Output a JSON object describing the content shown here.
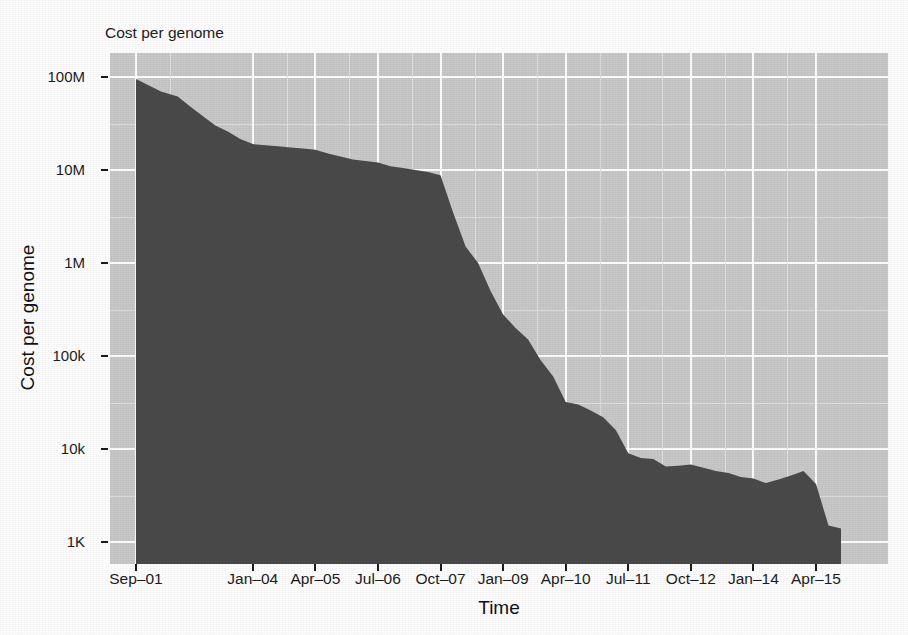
{
  "chart_data": {
    "type": "area",
    "title": "Cost per genome",
    "xlabel": "Time",
    "ylabel": "Cost per genome",
    "grid": true,
    "legend": false,
    "yscale": "log",
    "ylim": [
      1000,
      200000000
    ],
    "y_tick_labels": [
      "100M",
      "10M",
      "1M",
      "100k",
      "10k",
      "1K"
    ],
    "y_tick_values": [
      100000000,
      10000000,
      1000000,
      100000,
      10000,
      1000
    ],
    "x_tick_labels": [
      "Sep–01",
      "Jan–04",
      "Apr–05",
      "Jul–06",
      "Oct–07",
      "Jan–09",
      "Apr–10",
      "Jul–11",
      "Oct–12",
      "Jan–14",
      "Apr–15"
    ],
    "colors": {
      "area_fill": "#4a4a4a",
      "panel_background": "#c9c9c9",
      "gridline": "#ffffff",
      "text": "#1c1c1c",
      "figure_background": "#ffffff"
    },
    "series": [
      {
        "name": "Cost per genome",
        "points": [
          {
            "x": "Sep-01",
            "y": 95000000
          },
          {
            "x": "Mar-02",
            "y": 70000000
          },
          {
            "x": "Jul-02",
            "y": 61500000
          },
          {
            "x": "Oct-02",
            "y": 48000000
          },
          {
            "x": "Jan-03",
            "y": 38000000
          },
          {
            "x": "Apr-03",
            "y": 30000000
          },
          {
            "x": "Jul-03",
            "y": 26000000
          },
          {
            "x": "Oct-03",
            "y": 21500000
          },
          {
            "x": "Jan-04",
            "y": 19000000
          },
          {
            "x": "Apr-04",
            "y": 18500000
          },
          {
            "x": "Jul-04",
            "y": 18000000
          },
          {
            "x": "Oct-04",
            "y": 17500000
          },
          {
            "x": "Jan-05",
            "y": 17000000
          },
          {
            "x": "Apr-05",
            "y": 16500000
          },
          {
            "x": "Jul-05",
            "y": 15000000
          },
          {
            "x": "Oct-05",
            "y": 14000000
          },
          {
            "x": "Jan-06",
            "y": 13000000
          },
          {
            "x": "Apr-06",
            "y": 12500000
          },
          {
            "x": "Jul-06",
            "y": 12000000
          },
          {
            "x": "Oct-06",
            "y": 11000000
          },
          {
            "x": "Jan-07",
            "y": 10500000
          },
          {
            "x": "Apr-07",
            "y": 10000000
          },
          {
            "x": "Jul-07",
            "y": 9500000
          },
          {
            "x": "Oct-07",
            "y": 8800000
          },
          {
            "x": "Jan-08",
            "y": 3500000
          },
          {
            "x": "Apr-08",
            "y": 1500000
          },
          {
            "x": "Jul-08",
            "y": 1000000
          },
          {
            "x": "Oct-08",
            "y": 500000
          },
          {
            "x": "Jan-09",
            "y": 280000
          },
          {
            "x": "Apr-09",
            "y": 200000
          },
          {
            "x": "Jul-09",
            "y": 150000
          },
          {
            "x": "Oct-09",
            "y": 90000
          },
          {
            "x": "Jan-10",
            "y": 60000
          },
          {
            "x": "Apr-10",
            "y": 32000
          },
          {
            "x": "Jul-10",
            "y": 30000
          },
          {
            "x": "Oct-10",
            "y": 26000
          },
          {
            "x": "Jan-11",
            "y": 22000
          },
          {
            "x": "Apr-11",
            "y": 16000
          },
          {
            "x": "Jul-11",
            "y": 9000
          },
          {
            "x": "Oct-11",
            "y": 8000
          },
          {
            "x": "Jan-12",
            "y": 7800
          },
          {
            "x": "Apr-12",
            "y": 6500
          },
          {
            "x": "Jul-12",
            "y": 6600
          },
          {
            "x": "Oct-12",
            "y": 6800
          },
          {
            "x": "Jan-13",
            "y": 6300
          },
          {
            "x": "Apr-13",
            "y": 5800
          },
          {
            "x": "Jul-13",
            "y": 5500
          },
          {
            "x": "Oct-13",
            "y": 5000
          },
          {
            "x": "Jan-14",
            "y": 4800
          },
          {
            "x": "Apr-14",
            "y": 4300
          },
          {
            "x": "Jul-14",
            "y": 4700
          },
          {
            "x": "Oct-14",
            "y": 5200
          },
          {
            "x": "Jan-15",
            "y": 5800
          },
          {
            "x": "Apr-15",
            "y": 4200
          },
          {
            "x": "Jul-15",
            "y": 1500
          },
          {
            "x": "Oct-15",
            "y": 1400
          }
        ]
      }
    ]
  }
}
